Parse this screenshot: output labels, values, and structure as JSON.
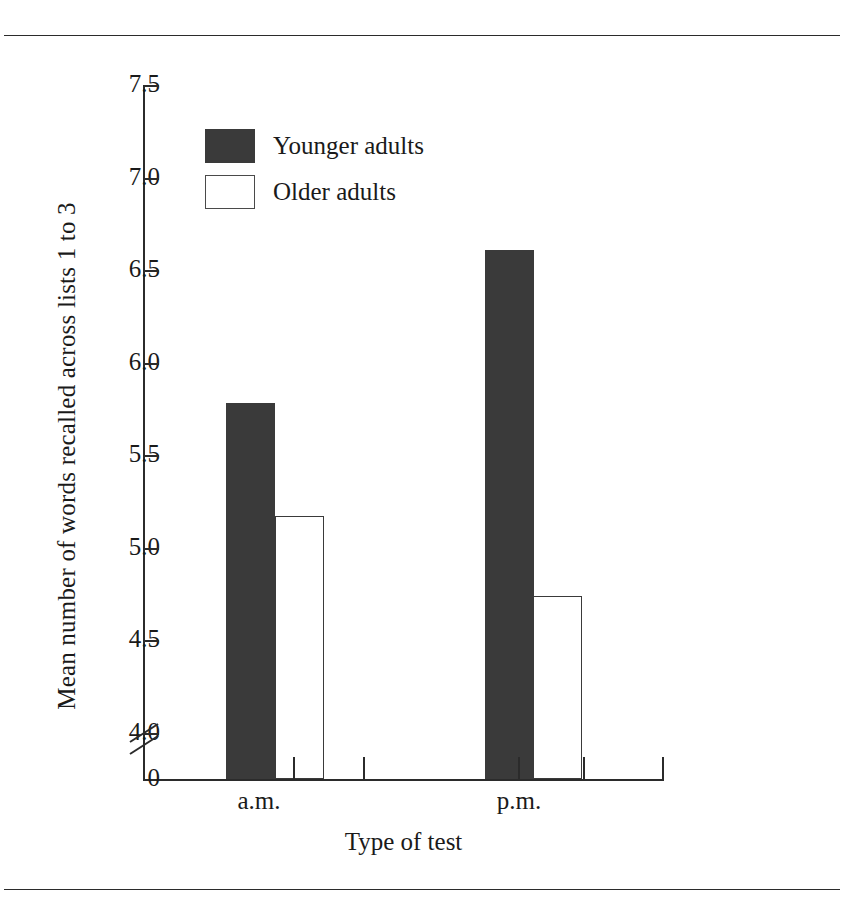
{
  "figure": {
    "rules": {
      "top": "horizontal-rule",
      "bottom": "horizontal-rule"
    }
  },
  "legend": {
    "position": "upper-left-inside",
    "items": [
      {
        "label": "Younger adults",
        "swatch": "filled-dark-square",
        "color": "#3a3a3a"
      },
      {
        "label": "Older adults",
        "swatch": "open-white-square",
        "color": "#ffffff"
      }
    ]
  },
  "chart_data": {
    "type": "bar",
    "title": "",
    "xlabel": "Type of test",
    "ylabel": "Mean number of words recalled across lists 1 to 3",
    "categories": [
      "a.m.",
      "p.m."
    ],
    "series": [
      {
        "name": "Younger adults",
        "values": [
          5.78,
          6.61
        ],
        "color": "#3a3a3a"
      },
      {
        "name": "Older adults",
        "values": [
          5.17,
          4.74
        ],
        "color": "#ffffff"
      }
    ],
    "ylim": [
      3.75,
      7.5
    ],
    "yticks": [
      7.5,
      7.0,
      6.5,
      6.0,
      5.5,
      5.0,
      4.5,
      4.0
    ],
    "ytick_labels": [
      "7.5",
      "7.0",
      "6.5",
      "6.0",
      "5.5",
      "5.0",
      "4.5",
      "4.0"
    ],
    "axis_break": true,
    "axis_break_label": "0",
    "grid": false,
    "legend_position": "upper left"
  }
}
